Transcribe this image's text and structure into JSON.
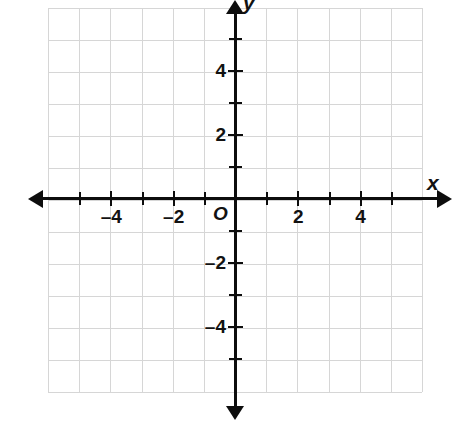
{
  "chart_data": {
    "type": "scatter",
    "title": "",
    "subtitle": "",
    "xlabel": "x",
    "ylabel": "y",
    "xlim": [
      -6,
      6
    ],
    "ylim": [
      -6,
      6
    ],
    "grid": true,
    "legend": null,
    "series": [],
    "x": [],
    "y": [],
    "annotations": [],
    "origin_label": "O",
    "x_tick_labels": [
      "-4",
      "-2",
      "2",
      "4"
    ],
    "x_tick_values": [
      -4,
      -2,
      2,
      4
    ],
    "y_tick_labels": [
      "4",
      "2",
      "-2",
      "-4"
    ],
    "y_tick_values": [
      4,
      2,
      -2,
      -4
    ],
    "x_minor_ticks": [
      -5,
      -4,
      -3,
      -2,
      -1,
      1,
      2,
      3,
      4,
      5
    ],
    "y_minor_ticks": [
      -5,
      -4,
      -3,
      -2,
      -1,
      1,
      2,
      3,
      4,
      5
    ],
    "grid_columns": 12,
    "grid_rows": 12,
    "colors": {
      "grid": "#d6d6d6",
      "axis": "#0d0d0d",
      "text": "#121212",
      "background": "#ffffff"
    }
  },
  "axes": {
    "x_name": "x",
    "y_name": "y",
    "origin": "O"
  },
  "x_labels": [
    {
      "text": "-4",
      "value": -4
    },
    {
      "text": "-2",
      "value": -2
    },
    {
      "text": "2",
      "value": 2
    },
    {
      "text": "4",
      "value": 4
    }
  ],
  "y_labels": [
    {
      "text": "4",
      "value": 4
    },
    {
      "text": "2",
      "value": 2
    },
    {
      "text": "-2",
      "value": -2
    },
    {
      "text": "-4",
      "value": -4
    }
  ]
}
